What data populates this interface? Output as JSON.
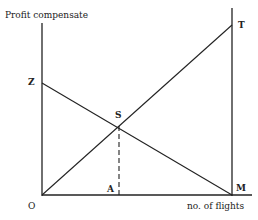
{
  "diagram": {
    "y_axis_label": "Profit compensate",
    "x_axis_label": "no. of flights",
    "points": {
      "origin": "O",
      "z": "Z",
      "t": "T",
      "s": "S",
      "a": "A",
      "m": "M"
    },
    "lines": [
      {
        "name": "ZM",
        "from": "Z",
        "to": "M"
      },
      {
        "name": "OT",
        "from": "O",
        "to": "T"
      },
      {
        "name": "SA",
        "from": "S",
        "to": "A",
        "style": "dashed"
      }
    ],
    "colors": {
      "line": "#222222",
      "background": "#ffffff"
    }
  }
}
